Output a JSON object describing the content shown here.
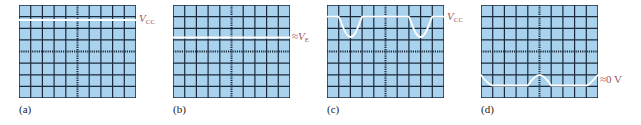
{
  "figure": {
    "grid": {
      "columns": 10,
      "rows": 8,
      "screen_color": "#a9d2ef",
      "grid_color": "#1a2a3a",
      "trace_color": "#ffffff",
      "label_color": "#a0525a"
    },
    "panels": [
      {
        "id": "a",
        "caption": "(a)",
        "label_main": "V",
        "label_sub": "CC",
        "label_prefix": "",
        "description": "Flat trace at V_CC level near top of screen"
      },
      {
        "id": "b",
        "caption": "(b)",
        "label_main": "V",
        "label_sub": "E",
        "label_prefix": "≈",
        "description": "Flat trace at approximately V_E level"
      },
      {
        "id": "c",
        "caption": "(c)",
        "label_main": "V",
        "label_sub": "CC",
        "label_prefix": "",
        "description": "Trace at V_CC with periodic negative half-cycle dips"
      },
      {
        "id": "d",
        "caption": "(d)",
        "label_main": "0 V",
        "label_sub": "",
        "label_prefix": "≈",
        "description": "Trace near 0 V with periodic positive half-cycle peaks"
      }
    ]
  }
}
